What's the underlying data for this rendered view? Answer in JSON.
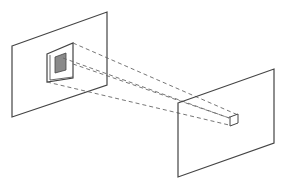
{
  "diagram": {
    "type": "convolution-receptive-field-projection",
    "colors": {
      "background": "#ffffff",
      "line": "#444444",
      "dashed": "#666666",
      "filter_fill": "#8a8a8a"
    },
    "elements": [
      {
        "name": "input-plane",
        "kind": "parallelogram"
      },
      {
        "name": "receptive-field-window",
        "kind": "parallelogram"
      },
      {
        "name": "kernel-region",
        "kind": "filled-square"
      },
      {
        "name": "projection-lines",
        "kind": "dashed-lines",
        "count": 4
      },
      {
        "name": "output-plane",
        "kind": "parallelogram"
      },
      {
        "name": "output-unit",
        "kind": "small-square"
      }
    ]
  }
}
